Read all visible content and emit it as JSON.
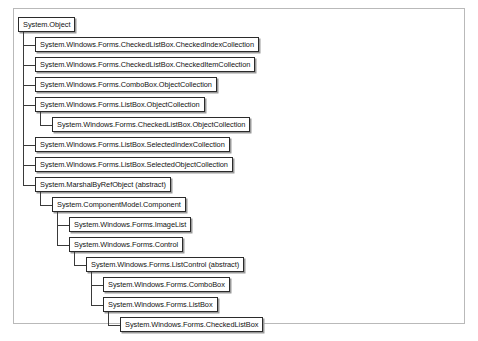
{
  "diagram": {
    "type": "class-inheritance-tree",
    "title": "",
    "root": "System.Object",
    "nodes": [
      {
        "id": "n0",
        "label": "System.Object",
        "depth": 0,
        "parent": null,
        "abstract": false
      },
      {
        "id": "n1",
        "label": "System.Windows.Forms.CheckedListBox.CheckedIndexCollection",
        "depth": 1,
        "parent": "n0",
        "abstract": false
      },
      {
        "id": "n2",
        "label": "System.Windows.Forms.CheckedListBox.CheckedItemCollection",
        "depth": 1,
        "parent": "n0",
        "abstract": false
      },
      {
        "id": "n3",
        "label": "System.Windows.Forms.ComboBox.ObjectCollection",
        "depth": 1,
        "parent": "n0",
        "abstract": false
      },
      {
        "id": "n4",
        "label": "System.Windows.Forms.ListBox.ObjectCollection",
        "depth": 1,
        "parent": "n0",
        "abstract": false
      },
      {
        "id": "n5",
        "label": "System.Windows.Forms.CheckedListBox.ObjectCollection",
        "depth": 2,
        "parent": "n4",
        "abstract": false
      },
      {
        "id": "n6",
        "label": "System.Windows.Forms.ListBox.SelectedIndexCollection",
        "depth": 1,
        "parent": "n0",
        "abstract": false
      },
      {
        "id": "n7",
        "label": "System.Windows.Forms.ListBox.SelectedObjectCollection",
        "depth": 1,
        "parent": "n0",
        "abstract": false
      },
      {
        "id": "n8",
        "label": "System.MarshalByRefObject (abstract)",
        "depth": 1,
        "parent": "n0",
        "abstract": true
      },
      {
        "id": "n9",
        "label": "System.ComponentModel.Component",
        "depth": 2,
        "parent": "n8",
        "abstract": false
      },
      {
        "id": "n10",
        "label": "System.Windows.Forms.ImageList",
        "depth": 3,
        "parent": "n9",
        "abstract": false
      },
      {
        "id": "n11",
        "label": "System.Windows.Forms.Control",
        "depth": 3,
        "parent": "n9",
        "abstract": false
      },
      {
        "id": "n12",
        "label": "System.Windows.Forms.ListControl (abstract)",
        "depth": 4,
        "parent": "n11",
        "abstract": true
      },
      {
        "id": "n13",
        "label": "System.Windows.Forms.ComboBox",
        "depth": 5,
        "parent": "n12",
        "abstract": false
      },
      {
        "id": "n14",
        "label": "System.Windows.Forms.ListBox",
        "depth": 5,
        "parent": "n12",
        "abstract": false
      },
      {
        "id": "n15",
        "label": "System.Windows.Forms.CheckedListBox",
        "depth": 6,
        "parent": "n14",
        "abstract": false
      }
    ],
    "colors": {
      "node_border": "#2b2b2b",
      "node_fill": "#ffffff",
      "node_shadow": "#9a9a9a",
      "connector": "#3a3a3a",
      "page_border": "#b9b9b9",
      "text": "#121212"
    }
  }
}
